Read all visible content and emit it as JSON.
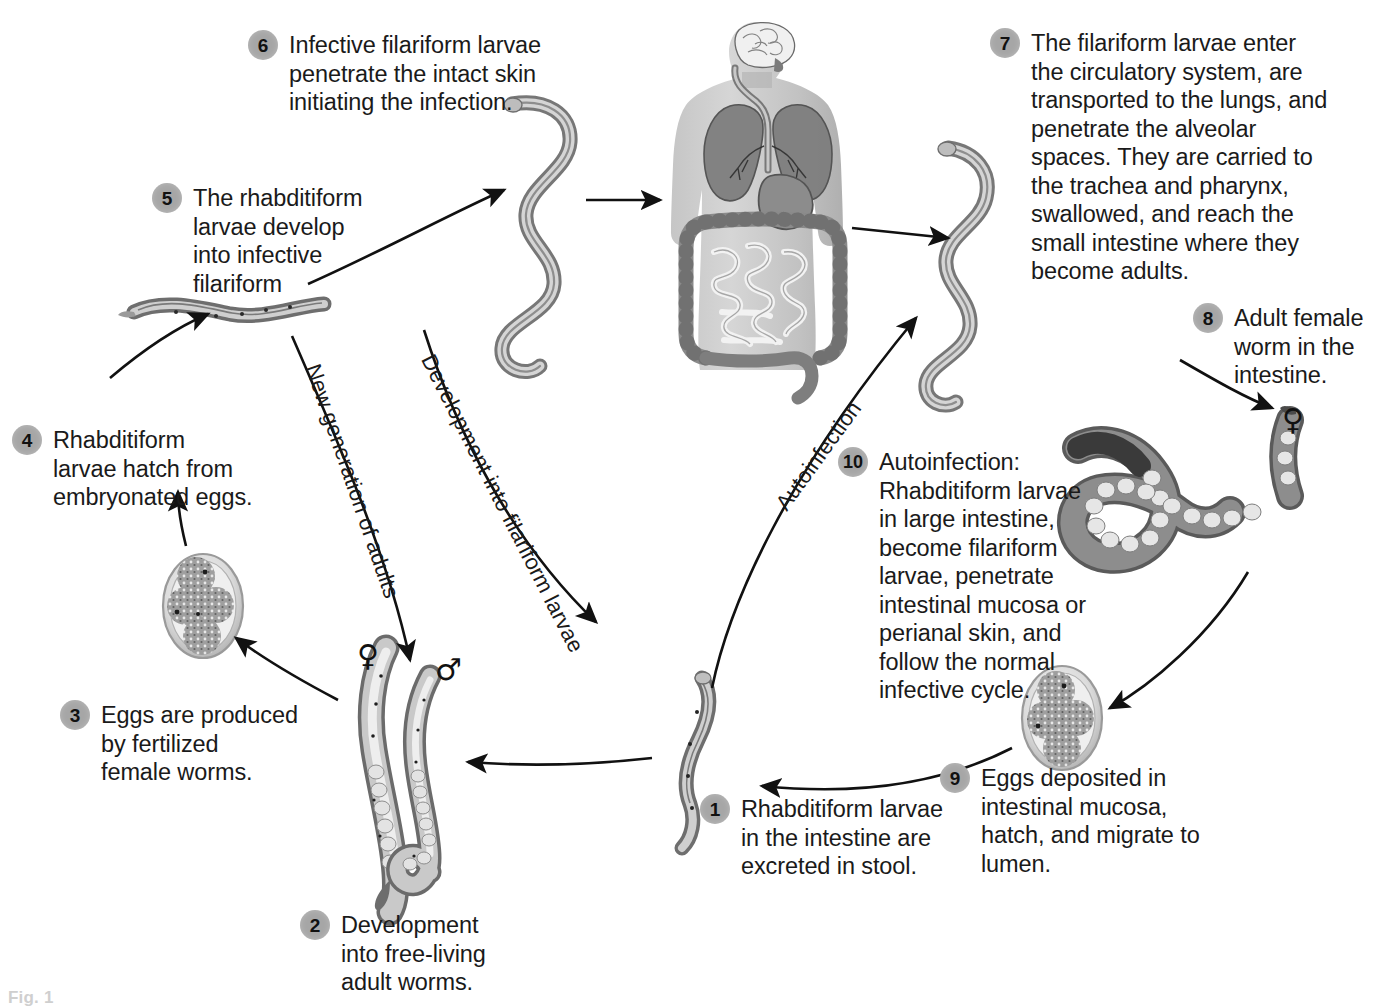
{
  "figure": {
    "background_color": "#ffffff",
    "bullet_color": "#a6a6a6",
    "line_color": "#111111",
    "caption_fragment": "Fig. 1"
  },
  "steps": [
    {
      "number": "1",
      "text": "Rhabditiform larvae\nin the intestine are\nexcreted in stool.",
      "x": 700,
      "y": 794,
      "width": 250
    },
    {
      "number": "2",
      "text": "Development\ninto free-living\nadult worms.",
      "x": 300,
      "y": 910,
      "width": 240
    },
    {
      "number": "3",
      "text": "Eggs are produced\nby fertilized\nfemale worms.",
      "x": 60,
      "y": 700,
      "width": 240
    },
    {
      "number": "4",
      "text": "Rhabditiform\nlarvae hatch from\nembryonated eggs.",
      "x": 12,
      "y": 425,
      "width": 235
    },
    {
      "number": "5",
      "text": "The rhabditiform\nlarvae develop\ninto infective\nfilariform",
      "x": 152,
      "y": 183,
      "width": 215
    },
    {
      "number": "6",
      "text": "Infective filariform larvae\npenetrate the intact skin\ninitiating the infection.",
      "x": 248,
      "y": 30,
      "width": 330
    },
    {
      "number": "7",
      "text": "The filariform larvae enter\nthe circulatory system, are\ntransported to the lungs, and\npenetrate the alveolar\nspaces. They are carried to\nthe trachea and pharynx,\nswallowed, and reach the\nsmall intestine where they\nbecome adults.",
      "x": 990,
      "y": 28,
      "width": 350
    },
    {
      "number": "8",
      "text": "Adult female\nworm in the\nintestine.",
      "x": 1193,
      "y": 303,
      "width": 185
    },
    {
      "number": "9",
      "text": "Eggs deposited in\nintestinal mucosa,\nhatch, and migrate to\nlumen.",
      "x": 940,
      "y": 763,
      "width": 265
    },
    {
      "number": "10",
      "text": "Autoinfection:\nRhabditiform larvae\nin large intestine,\nbecome filariform\nlarvae, penetrate\nintestinal mucosa or\nperianal skin, and\nfollow the normal\ninfective cycle.",
      "x": 838,
      "y": 447,
      "width": 250
    }
  ],
  "curve_labels": [
    {
      "text": "New generation of adults",
      "x": 312,
      "y": 352,
      "rotate": 71
    },
    {
      "text": "Development into filariform larvae",
      "x": 427,
      "y": 343,
      "rotate": 63
    },
    {
      "text": "Autoinfection",
      "x": 781,
      "y": 495,
      "rotate": -54
    }
  ],
  "gender_marks": [
    {
      "symbol": "♀",
      "label": "female-symbol-free-living",
      "x": 357,
      "y": 641
    },
    {
      "symbol": "♂",
      "label": "male-symbol-free-living",
      "x": 435,
      "y": 655
    },
    {
      "symbol": "♀",
      "label": "female-symbol-adult-intestine",
      "x": 1282,
      "y": 405
    }
  ],
  "illustrations": [
    {
      "name": "filariform-larva-penetrating-skin",
      "description": "S-shaped infective filariform larva, upper middle-left"
    },
    {
      "name": "human-body-organs",
      "description": "Grey human torso silhouette showing brain, trachea, lungs, stomach, small and large intestine"
    },
    {
      "name": "filariform-larva-in-circulation",
      "description": "S-shaped filariform larva, upper right"
    },
    {
      "name": "rhabditiform-larva-developing",
      "description": "Horizontal rhabditiform larva left side, step 5"
    },
    {
      "name": "embryonated-egg-free-living",
      "description": "Oval embryonated egg with internal cells, left side, step 3/4"
    },
    {
      "name": "free-living-adult-female-worm",
      "description": "Long curved adult female worm with eggs, bottom left"
    },
    {
      "name": "free-living-adult-male-worm",
      "description": "Shorter curved adult male worm with hooked tail, bottom left"
    },
    {
      "name": "rhabditiform-larva-in-stool",
      "description": "Slender rhabditiform larva, bottom centre, step 1"
    },
    {
      "name": "adult-female-worm-intestine",
      "description": "Large coiled parasitic female worm filled with eggs, right side"
    },
    {
      "name": "embryonated-egg-intestinal-mucosa",
      "description": "Oval egg with internal cells, lower right, step 9"
    }
  ]
}
